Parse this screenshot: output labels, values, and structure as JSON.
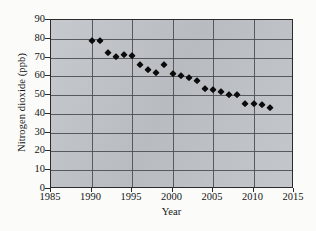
{
  "chart_data": {
    "type": "scatter",
    "title": "",
    "xlabel": "Year",
    "ylabel": "Nitrogen dioxide (ppb)",
    "xlim": [
      1985,
      2015
    ],
    "ylim": [
      0,
      90
    ],
    "xticks": [
      1985,
      1990,
      1995,
      2000,
      2005,
      2010,
      2015
    ],
    "yticks": [
      0,
      10,
      20,
      30,
      40,
      50,
      60,
      70,
      80,
      90
    ],
    "xtick_labels": [
      "1985",
      "1990",
      "1995",
      "2000",
      "2005",
      "2010",
      "2015"
    ],
    "ytick_labels": [
      "0",
      "10",
      "20",
      "30",
      "40",
      "50",
      "60",
      "70",
      "80",
      "90"
    ],
    "grid": true,
    "grid_axis": "both",
    "legend": false,
    "marker": "diamond",
    "marker_color": "#0b0b0b",
    "plot_background": "#bfc3c8",
    "figure_background": "#fbfbfa",
    "gridline_color": "#4d5055",
    "axis_color": "#2b2b2b",
    "x": [
      1990,
      1991,
      1992,
      1993,
      1994,
      1995,
      1996,
      1997,
      1998,
      1999,
      2000,
      2001,
      2002,
      2003,
      2004,
      2005,
      2006,
      2007,
      2008,
      2009,
      2010,
      2011,
      2012
    ],
    "values": [
      79.0,
      79.0,
      72.5,
      70.5,
      71.5,
      71.0,
      66.0,
      63.5,
      62.0,
      66.0,
      61.5,
      60.0,
      59.0,
      57.5,
      53.0,
      52.5,
      51.5,
      50.0,
      50.0,
      45.5,
      45.5,
      44.5,
      43.0
    ],
    "points": [
      {
        "year": 1990,
        "ppb": 79.0
      },
      {
        "year": 1991,
        "ppb": 79.0
      },
      {
        "year": 1992,
        "ppb": 72.5
      },
      {
        "year": 1993,
        "ppb": 70.5
      },
      {
        "year": 1994,
        "ppb": 71.5
      },
      {
        "year": 1995,
        "ppb": 71.0
      },
      {
        "year": 1996,
        "ppb": 66.0
      },
      {
        "year": 1997,
        "ppb": 63.5
      },
      {
        "year": 1998,
        "ppb": 62.0
      },
      {
        "year": 1999,
        "ppb": 66.0
      },
      {
        "year": 2000,
        "ppb": 61.5
      },
      {
        "year": 2001,
        "ppb": 60.0
      },
      {
        "year": 2002,
        "ppb": 59.0
      },
      {
        "year": 2003,
        "ppb": 57.5
      },
      {
        "year": 2004,
        "ppb": 53.0
      },
      {
        "year": 2005,
        "ppb": 52.5
      },
      {
        "year": 2006,
        "ppb": 51.5
      },
      {
        "year": 2007,
        "ppb": 50.0
      },
      {
        "year": 2008,
        "ppb": 50.0
      },
      {
        "year": 2009,
        "ppb": 45.5
      },
      {
        "year": 2010,
        "ppb": 45.5
      },
      {
        "year": 2011,
        "ppb": 44.5
      },
      {
        "year": 2012,
        "ppb": 43.0
      }
    ]
  }
}
